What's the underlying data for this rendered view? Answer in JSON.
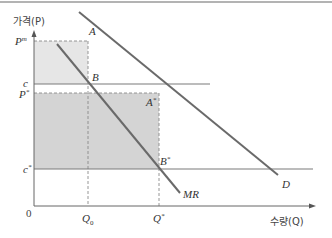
{
  "diagram": {
    "axes": {
      "y_label": "가격(P)",
      "x_label": "수량(Q)",
      "origin": "0"
    },
    "y_ticks": [
      {
        "key": "pm",
        "label": "P",
        "sup": "m"
      },
      {
        "key": "c",
        "label": "c",
        "sup": ""
      },
      {
        "key": "pstar",
        "label": "P",
        "sup": "*"
      },
      {
        "key": "cstar",
        "label": "c",
        "sup": "*"
      }
    ],
    "x_ticks": [
      {
        "key": "q0",
        "label": "Q",
        "sub": "0"
      },
      {
        "key": "qstar",
        "label": "Q",
        "sup": "*"
      }
    ],
    "curves": [
      {
        "key": "D",
        "label": "D",
        "desc": "demand curve"
      },
      {
        "key": "MR",
        "label": "MR",
        "desc": "marginal revenue curve"
      }
    ],
    "points": [
      {
        "key": "A",
        "label": "A",
        "sup": ""
      },
      {
        "key": "B",
        "label": "B",
        "sup": ""
      },
      {
        "key": "Astar",
        "label": "A",
        "sup": "*"
      },
      {
        "key": "Bstar",
        "label": "B",
        "sup": "*"
      }
    ],
    "colors": {
      "line": "#6e6e6e",
      "shade_light": "#e4e4e4",
      "shade_dark": "#d2d2d2",
      "dash": "#8a8a8a"
    }
  }
}
